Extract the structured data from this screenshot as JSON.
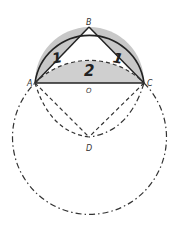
{
  "diagram": {
    "points": [
      {
        "id": "A",
        "label": "A",
        "x": 35,
        "y": 83
      },
      {
        "id": "B",
        "label": "B",
        "x": 89,
        "y": 27
      },
      {
        "id": "C",
        "label": "C",
        "x": 144,
        "y": 83
      },
      {
        "id": "O",
        "label": "O",
        "x": 89,
        "y": 83
      },
      {
        "id": "D",
        "label": "D",
        "x": 89,
        "y": 137
      }
    ],
    "regions": [
      {
        "id": "lune-left",
        "label": "1",
        "fill": "#c8c8c8"
      },
      {
        "id": "lune-right",
        "label": "1",
        "fill": "#c8c8c8"
      },
      {
        "id": "segment",
        "label": "2",
        "fill": "#cfcfcf"
      }
    ],
    "colors": {
      "stroke": "#222222",
      "shade": "#c8c8c8",
      "background": "#ffffff"
    }
  }
}
